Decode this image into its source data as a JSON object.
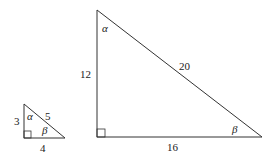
{
  "small_triangle": {
    "side_vertical": "3",
    "side_horizontal": "4",
    "hypotenuse": "5",
    "angle_top": "α",
    "angle_right": "β"
  },
  "large_triangle": {
    "side_vertical": "12",
    "side_horizontal": "16",
    "hypotenuse": "20",
    "angle_top": "α",
    "angle_right": "β"
  },
  "colors": {
    "stroke": "#333333",
    "background": "#ffffff"
  }
}
